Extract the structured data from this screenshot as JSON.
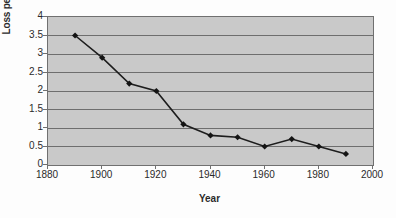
{
  "chart_data": {
    "type": "line",
    "title": "",
    "xlabel": "Year",
    "ylabel": "Loss percentage/year",
    "x": [
      1890,
      1900,
      1910,
      1920,
      1930,
      1940,
      1950,
      1960,
      1970,
      1980,
      1990
    ],
    "values": [
      3.5,
      2.9,
      2.2,
      2.0,
      1.1,
      0.8,
      0.75,
      0.5,
      0.7,
      0.5,
      0.3
    ],
    "series": [
      {
        "name": "Loss percentage/year",
        "values": [
          3.5,
          2.9,
          2.2,
          2.0,
          1.1,
          0.8,
          0.75,
          0.5,
          0.7,
          0.5,
          0.3
        ]
      }
    ],
    "xlim": [
      1880,
      2000
    ],
    "ylim": [
      0,
      4
    ],
    "xticks": [
      1880,
      1900,
      1920,
      1940,
      1960,
      1980,
      2000
    ],
    "xtick_labels": [
      "1880",
      "1900",
      "1920",
      "1940",
      "1960",
      "1980",
      "2000"
    ],
    "yticks": [
      0,
      0.5,
      1,
      1.5,
      2,
      2.5,
      3,
      3.5,
      4
    ],
    "ytick_labels": [
      "0",
      "0.5",
      "1",
      "1.5",
      "2",
      "2.5",
      "3",
      "3.5",
      "4"
    ],
    "grid": "horizontal",
    "legend": "none",
    "marker": "diamond",
    "colors": {
      "plot_background": "#c9c9c9",
      "gridline": "#6e6e6e",
      "axis": "#707070",
      "series_line": "#1d1d1d",
      "marker": "#141414",
      "text": "#2b2b2b",
      "figure_background": "#fdfdfd"
    }
  }
}
